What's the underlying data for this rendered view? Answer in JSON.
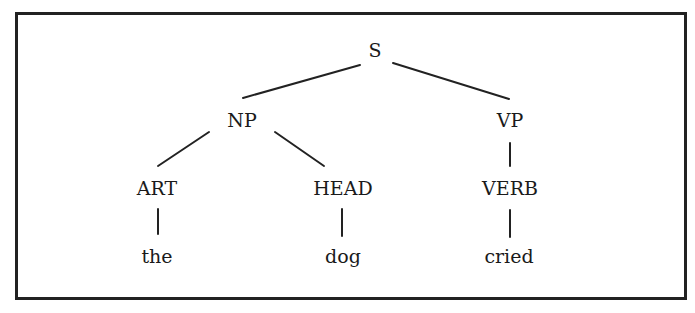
{
  "diagram": {
    "type": "parse-tree",
    "nodes": {
      "S": {
        "label": "S",
        "x": 375,
        "y": 50
      },
      "NP": {
        "label": "NP",
        "x": 242,
        "y": 120
      },
      "VP": {
        "label": "VP",
        "x": 510,
        "y": 120
      },
      "ART": {
        "label": "ART",
        "x": 157,
        "y": 188
      },
      "HEAD": {
        "label": "HEAD",
        "x": 343,
        "y": 188
      },
      "VERB": {
        "label": "VERB",
        "x": 510,
        "y": 188
      },
      "the": {
        "label": "the",
        "x": 157,
        "y": 256
      },
      "dog": {
        "label": "dog",
        "x": 343,
        "y": 256
      },
      "cried": {
        "label": "cried",
        "x": 510,
        "y": 256
      }
    },
    "edges": [
      [
        "S",
        "NP"
      ],
      [
        "S",
        "VP"
      ],
      [
        "NP",
        "ART"
      ],
      [
        "NP",
        "HEAD"
      ],
      [
        "VP",
        "VERB"
      ],
      [
        "ART",
        "the"
      ],
      [
        "HEAD",
        "dog"
      ],
      [
        "VERB",
        "cried"
      ]
    ]
  }
}
